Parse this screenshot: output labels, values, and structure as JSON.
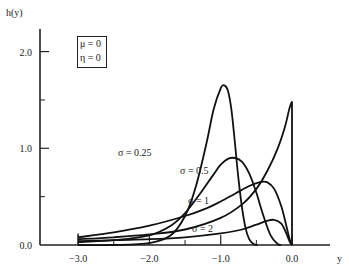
{
  "chart_data": {
    "type": "line",
    "title": "",
    "xlabel": "y",
    "ylabel": "h(y)",
    "xlim": [
      -3.6,
      0.5
    ],
    "ylim": [
      0,
      2.25
    ],
    "x_ticks": [
      -3.0,
      -2.0,
      -1.0,
      0.0
    ],
    "x_tick_labels": [
      "−3.0",
      "−2.0",
      "−1.0",
      "0.0"
    ],
    "x_minor_ticks": [
      -2.5,
      -1.5,
      -0.5
    ],
    "y_ticks": [
      0.0,
      1.0,
      2.0
    ],
    "y_tick_labels": [
      "0.0",
      "1.0",
      "2.0"
    ],
    "y_minor_ticks": [
      0.5,
      1.5
    ],
    "legend": [
      "μ = 0",
      "η = 0"
    ],
    "legend_position": "top-left",
    "series": [
      {
        "name": "σ = 0.25",
        "label": "σ = 0.25",
        "x": [
          -3.0,
          -2.5,
          -2.0,
          -1.7,
          -1.5,
          -1.35,
          -1.2,
          -1.1,
          -1.0,
          -0.95,
          -0.9,
          -0.85,
          -0.8,
          -0.75,
          -0.7,
          -0.65,
          -0.6,
          -0.55,
          -0.5,
          -0.48
        ],
        "y": [
          0.0,
          0.0,
          0.02,
          0.1,
          0.3,
          0.6,
          1.05,
          1.4,
          1.62,
          1.65,
          1.6,
          1.4,
          1.05,
          0.68,
          0.38,
          0.17,
          0.06,
          0.015,
          0.0,
          0.0
        ]
      },
      {
        "name": "σ = 0.5",
        "label": "σ = 0.5",
        "x": [
          -3.0,
          -2.5,
          -2.0,
          -1.7,
          -1.5,
          -1.3,
          -1.1,
          -1.0,
          -0.9,
          -0.8,
          -0.7,
          -0.6,
          -0.5,
          -0.4,
          -0.3,
          -0.2,
          -0.15
        ],
        "y": [
          0.03,
          0.05,
          0.1,
          0.2,
          0.33,
          0.52,
          0.73,
          0.83,
          0.89,
          0.9,
          0.86,
          0.74,
          0.54,
          0.3,
          0.1,
          0.01,
          0.0
        ]
      },
      {
        "name": "σ = 1",
        "label": "σ = 1",
        "x": [
          -3.0,
          -2.5,
          -2.0,
          -1.5,
          -1.2,
          -1.0,
          -0.8,
          -0.6,
          -0.45,
          -0.35,
          -0.25,
          -0.15,
          -0.08,
          -0.03,
          0.0
        ],
        "y": [
          0.08,
          0.13,
          0.2,
          0.3,
          0.38,
          0.45,
          0.53,
          0.61,
          0.65,
          0.65,
          0.58,
          0.4,
          0.2,
          0.05,
          0.0
        ]
      },
      {
        "name": "σ = 2",
        "label": "σ = 2",
        "x": [
          -3.0,
          -2.5,
          -2.0,
          -1.5,
          -1.0,
          -0.7,
          -0.5,
          -0.35,
          -0.25,
          -0.15,
          -0.08,
          -0.03,
          0.0
        ],
        "y": [
          0.04,
          0.05,
          0.06,
          0.08,
          0.12,
          0.16,
          0.21,
          0.25,
          0.26,
          0.22,
          0.12,
          0.03,
          0.0
        ]
      },
      {
        "name": "unlabeled",
        "label": "",
        "x": [
          -3.0,
          -2.5,
          -2.0,
          -1.5,
          -1.0,
          -0.7,
          -0.5,
          -0.35,
          -0.2,
          -0.1,
          -0.04,
          -0.01,
          0.0,
          0.0
        ],
        "y": [
          0.06,
          0.08,
          0.11,
          0.16,
          0.28,
          0.42,
          0.58,
          0.76,
          1.0,
          1.22,
          1.4,
          1.47,
          1.48,
          0.0
        ]
      }
    ]
  }
}
